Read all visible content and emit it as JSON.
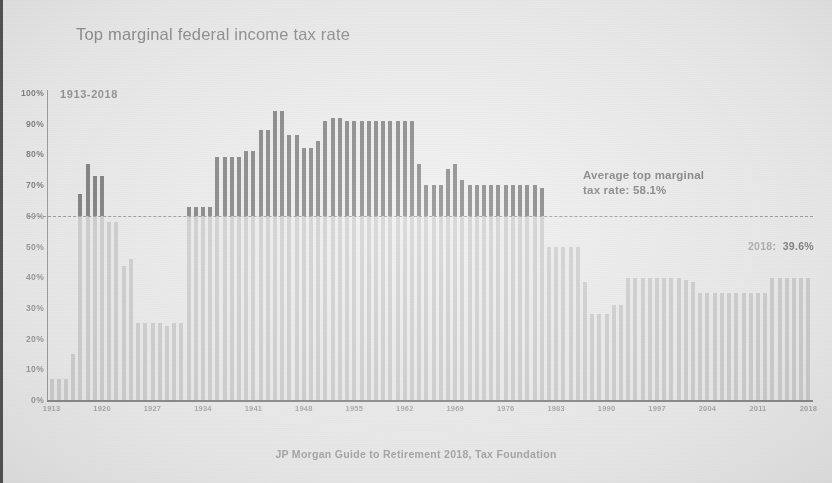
{
  "chart_title": "Top marginal federal income tax rate",
  "range_label": "1913-2018",
  "source_note": "JP Morgan Guide to Retirement 2018, Tax Foundation",
  "annotations": {
    "average_line": "Average top marginal\ntax rate: 58.1%",
    "average_line_1": "Average top marginal",
    "average_line_2": "tax rate: 58.1%",
    "average_value_pct": 58.1,
    "last_point_year": "2018",
    "last_point_value": "39.6%",
    "last_point_label": "2018:  39.6%"
  },
  "colors": {
    "bar_below": "#c9c9c7",
    "bar_above": "#6e6e6e",
    "axis": "#8e8e8e",
    "text": "#8a8a8a",
    "background": "#ececea"
  },
  "chart_data": {
    "type": "bar",
    "title": "Top marginal federal income tax rate",
    "subtitle": "1913-2018",
    "xlabel": "",
    "ylabel": "",
    "ylim": [
      0,
      100
    ],
    "grid": false,
    "legend": "none",
    "y_ticks": [
      "0%",
      "10%",
      "20%",
      "30%",
      "40%",
      "50%",
      "60%",
      "70%",
      "80%",
      "90%",
      "100%"
    ],
    "y_tick_values": [
      0,
      10,
      20,
      30,
      40,
      50,
      60,
      70,
      80,
      90,
      100
    ],
    "x_ticks": [
      "1913",
      "1920",
      "1927",
      "1934",
      "1941",
      "1948",
      "1955",
      "1962",
      "1969",
      "1976",
      "1983",
      "1990",
      "1997",
      "2004",
      "2011",
      "2018"
    ],
    "threshold_line": {
      "value": 58.1,
      "drawn_at": 60,
      "style": "dashed",
      "label": "Average top marginal tax rate: 58.1%"
    },
    "categories": [
      1913,
      1914,
      1915,
      1916,
      1917,
      1918,
      1919,
      1920,
      1921,
      1922,
      1923,
      1924,
      1925,
      1926,
      1927,
      1928,
      1929,
      1930,
      1931,
      1932,
      1933,
      1934,
      1935,
      1936,
      1937,
      1938,
      1939,
      1940,
      1941,
      1942,
      1943,
      1944,
      1945,
      1946,
      1947,
      1948,
      1949,
      1950,
      1951,
      1952,
      1953,
      1954,
      1955,
      1956,
      1957,
      1958,
      1959,
      1960,
      1961,
      1962,
      1963,
      1964,
      1965,
      1966,
      1967,
      1968,
      1969,
      1970,
      1971,
      1972,
      1973,
      1974,
      1975,
      1976,
      1977,
      1978,
      1979,
      1980,
      1981,
      1982,
      1983,
      1984,
      1985,
      1986,
      1987,
      1988,
      1989,
      1990,
      1991,
      1992,
      1993,
      1994,
      1995,
      1996,
      1997,
      1998,
      1999,
      2000,
      2001,
      2002,
      2003,
      2004,
      2005,
      2006,
      2007,
      2008,
      2009,
      2010,
      2011,
      2012,
      2013,
      2014,
      2015,
      2016,
      2017,
      2018
    ],
    "values": [
      7,
      7,
      7,
      15,
      67,
      77,
      73,
      73,
      58,
      58,
      43.5,
      46,
      25,
      25,
      25,
      25,
      24,
      25,
      25,
      63,
      63,
      63,
      63,
      79,
      79,
      79,
      79,
      81.1,
      81,
      88,
      88,
      94,
      94,
      86.45,
      86.45,
      82.13,
      82.13,
      84.36,
      91,
      92,
      92,
      91,
      91,
      91,
      91,
      91,
      91,
      91,
      91,
      91,
      91,
      77,
      70,
      70,
      70,
      75.25,
      77,
      71.75,
      70,
      70,
      70,
      70,
      70,
      70,
      70,
      70,
      70,
      70,
      69.13,
      50,
      50,
      50,
      50,
      50,
      38.5,
      28,
      28,
      28,
      31,
      31,
      39.6,
      39.6,
      39.6,
      39.6,
      39.6,
      39.6,
      39.6,
      39.6,
      39.1,
      38.6,
      35,
      35,
      35,
      35,
      35,
      35,
      35,
      35,
      35,
      35,
      39.6,
      39.6,
      39.6,
      39.6,
      39.6,
      39.6
    ],
    "series": [
      {
        "name": "Top marginal federal income tax rate",
        "unit": "%"
      }
    ]
  }
}
